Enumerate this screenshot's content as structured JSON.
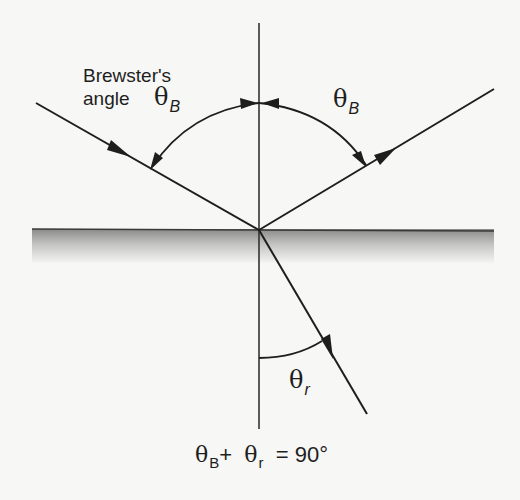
{
  "diagram": {
    "title": "Brewster's angle",
    "labels": {
      "brewster_line1": "Brewster's",
      "brewster_line2": "angle",
      "theta_symbol": "θ",
      "theta_b_sub": "B",
      "theta_r_sub": "r",
      "formula_theta_b_sub": "B",
      "formula_plus": "+",
      "formula_theta_r_sub": "r",
      "formula_equals": "= 90°"
    },
    "formula_text": "θB + θr = 90°",
    "elements": {
      "surface": "interface between two media (shaded lower medium)",
      "normal": "vertical normal line through point of incidence",
      "incident_ray": "incoming ray from upper left with arrow",
      "reflected_ray": "reflected ray toward upper right with arrow",
      "refracted_ray": "refracted ray into lower medium with arrow",
      "angle_arcs": [
        "θB incident angle (left)",
        "θB reflected angle (right)",
        "θr refraction angle"
      ]
    },
    "colors": {
      "background": "#f7f7f5",
      "line": "#1e1e1e",
      "surface_top": "#8a8a8a",
      "surface_bottom": "#f2f2f0"
    }
  }
}
